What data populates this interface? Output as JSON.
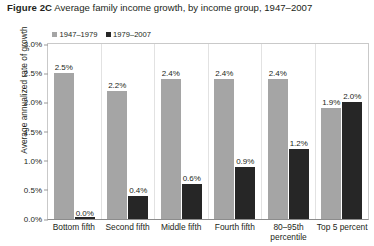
{
  "figure": {
    "number": "Figure 2C",
    "title": "Average family income growth, by income group, 1947–2007"
  },
  "legend": {
    "position": "top-left",
    "items": [
      {
        "label": "1947–1979",
        "color": "#a5a5a5"
      },
      {
        "label": "1979–2007",
        "color": "#262626"
      }
    ]
  },
  "axes": {
    "ylabel": "Average annualized rate of growth",
    "xlabel": "",
    "yticks": [
      "0.0%",
      "0.5%",
      "1.0%",
      "1.5%",
      "2.0%",
      "2.5%",
      "3.0%"
    ]
  },
  "chart_data": {
    "type": "bar",
    "title": "Average family income growth, by income group, 1947–2007",
    "xlabel": "",
    "ylabel": "Average annualized rate of growth",
    "ylim": [
      0,
      3.0
    ],
    "ytick_step": 0.5,
    "yunit": "%",
    "grid": false,
    "legend_position": "top-left",
    "categories": [
      "Bottom fifth",
      "Second fifth",
      "Middle fifth",
      "Fourth fifth",
      "80–95th percentile",
      "Top 5 percent"
    ],
    "series": [
      {
        "name": "1947–1979",
        "color": "#a5a5a5",
        "values": [
          2.5,
          2.2,
          2.4,
          2.4,
          2.4,
          1.9
        ],
        "labels": [
          "2.5%",
          "2.2%",
          "2.4%",
          "2.4%",
          "2.4%",
          "1.9%"
        ]
      },
      {
        "name": "1979–2007",
        "color": "#262626",
        "values": [
          0.0,
          0.4,
          0.6,
          0.9,
          1.2,
          2.0
        ],
        "labels": [
          "0.0%",
          "0.4%",
          "0.6%",
          "0.9%",
          "1.2%",
          "2.0%"
        ]
      }
    ]
  }
}
